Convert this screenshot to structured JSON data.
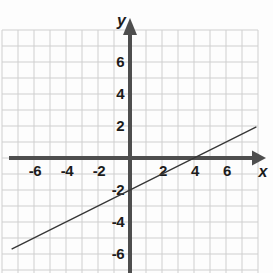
{
  "chart_data": {
    "type": "line",
    "title": "",
    "xlabel": "x",
    "ylabel": "y",
    "xlim": [
      -8,
      8
    ],
    "ylim": [
      -7.2,
      8
    ],
    "grid": true,
    "x_tick_values": [
      -6,
      -4,
      -2,
      2,
      4,
      6
    ],
    "x_tick_labels": [
      "-6",
      "-4",
      "-2",
      "2",
      "4",
      "6"
    ],
    "y_tick_values": [
      6,
      4,
      2,
      -2,
      -4,
      -6
    ],
    "y_tick_labels": [
      "6",
      "4",
      "2",
      "-2",
      "-4",
      "-6"
    ],
    "series": [
      {
        "name": "graphed-line",
        "equation": "y = (1/2)x - 2",
        "slope": 0.5,
        "y_intercept": -2,
        "x_intercept": 4,
        "points": [
          {
            "x": -7.4,
            "y": -5.7
          },
          {
            "x": 7.9,
            "y": 1.95
          }
        ]
      }
    ],
    "colors": {
      "background": "#fdfdfd",
      "grid": "#cfcfcf",
      "axis": "#4e4e4e",
      "tick_label": "#1c1c1c",
      "line": "#383838"
    },
    "legend": {
      "visible": false
    }
  }
}
